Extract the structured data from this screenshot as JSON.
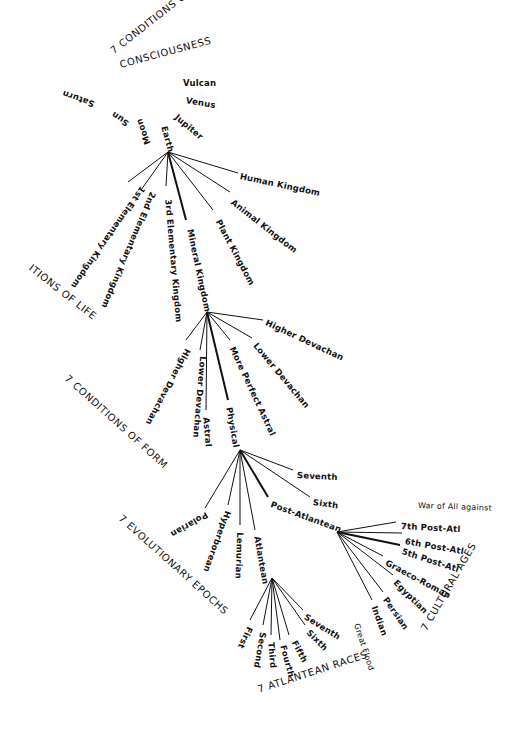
{
  "diagram": {
    "line_color": "#111111",
    "background": "#ffffff",
    "levels": [
      {
        "title": "7 CONDITIONS OF CONSCIOUSNESS",
        "title_line1": "7 CONDITIONS OF",
        "title_line2": "CONSCIOUSNESS",
        "nodes": [
          "Saturn",
          "Sun",
          "Moon",
          "Earth",
          "Jupiter",
          "Venus",
          "Vulcan"
        ],
        "current": "Earth"
      },
      {
        "title": "ITIONS OF LIFE",
        "nodes": [
          "1st Elementary Kingdom",
          "2nd Elementary Kingdom",
          "3rd Elementary Kingdom",
          "Mineral Kingdom",
          "Plant Kingdom",
          "Animal Kingdom",
          "Human Kingdom"
        ],
        "current": "Mineral Kingdom"
      },
      {
        "title": "7 CONDITIONS OF FORM",
        "nodes": [
          "Higher Devachan",
          "Lower Devachan",
          "Astral",
          "Physical",
          "More Perfect Astral",
          "Lower Devachan",
          "Higher Devachan"
        ],
        "current": "Physical"
      },
      {
        "title": "7 EVOLUTIONARY EPOCHS",
        "nodes": [
          "Polarian",
          "Hyperborean",
          "Lemurian",
          "Atlantean",
          "Post-Atlantean",
          "Sixth",
          "Seventh"
        ],
        "current": "Post-Atlantean"
      },
      {
        "title": "7 ATLANTEAN RACES",
        "nodes": [
          "First",
          "Second",
          "Third",
          "Fourth",
          "Fifth",
          "Sixth",
          "Seventh"
        ]
      },
      {
        "title": "7 CULTURAL AGES",
        "nodes": [
          "Indian",
          "Persian",
          "Egyptian",
          "Graeco-Roman",
          "5th Post-Atl",
          "6th Post-Atl",
          "7th Post-Atl"
        ],
        "current": "5th Post-Atl"
      }
    ],
    "annotations": {
      "great_flood": "Great Flood",
      "war": "War of All against"
    }
  }
}
